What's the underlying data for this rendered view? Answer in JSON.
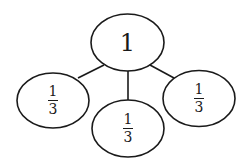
{
  "diagram": {
    "type": "tree",
    "root": {
      "id": "root",
      "label": "1",
      "cx": 127.5,
      "cy": 42.5,
      "rx": 36.5,
      "ry": 28.5
    },
    "children": [
      {
        "id": "left",
        "numerator": "1",
        "denominator": "3",
        "cx": 53,
        "cy": 100.5,
        "rx": 36,
        "ry": 27.5,
        "edge": {
          "x1": 104,
          "y1": 65,
          "x2": 78,
          "y2": 78
        }
      },
      {
        "id": "middle",
        "numerator": "1",
        "denominator": "3",
        "cx": 128,
        "cy": 128.5,
        "rx": 36,
        "ry": 28.5,
        "edge": {
          "x1": 128,
          "y1": 71,
          "x2": 128,
          "y2": 100
        }
      },
      {
        "id": "right",
        "numerator": "1",
        "denominator": "3",
        "cx": 199,
        "cy": 98.5,
        "rx": 36,
        "ry": 28,
        "edge": {
          "x1": 150,
          "y1": 65,
          "x2": 174,
          "y2": 78
        }
      }
    ],
    "colors": {
      "stroke": "#1a1a1a",
      "fill": "#ffffff",
      "background": "#ffffff"
    }
  }
}
